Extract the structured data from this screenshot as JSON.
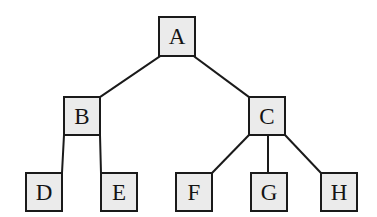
{
  "diagram": {
    "type": "tree",
    "title": "",
    "canvas": {
      "width": 377,
      "height": 217,
      "background": "#ffffff"
    },
    "style": {
      "node_fill": "#ebebeb",
      "node_border": "#1a1a1a",
      "node_border_width": 2,
      "edge_color": "#1a1a1a",
      "edge_width": 2,
      "label_color": "#141414"
    },
    "nodes": [
      {
        "id": "A",
        "label": "A",
        "x": 158,
        "y": 16,
        "w": 38,
        "h": 41,
        "level": 0
      },
      {
        "id": "B",
        "label": "B",
        "x": 63,
        "y": 96,
        "w": 38,
        "h": 40,
        "level": 1
      },
      {
        "id": "C",
        "label": "C",
        "x": 248,
        "y": 96,
        "w": 38,
        "h": 40,
        "level": 1
      },
      {
        "id": "D",
        "label": "D",
        "x": 25,
        "y": 172,
        "w": 38,
        "h": 40,
        "level": 2
      },
      {
        "id": "E",
        "label": "E",
        "x": 100,
        "y": 172,
        "w": 38,
        "h": 40,
        "level": 2
      },
      {
        "id": "F",
        "label": "F",
        "x": 175,
        "y": 172,
        "w": 38,
        "h": 40,
        "level": 2
      },
      {
        "id": "G",
        "label": "G",
        "x": 250,
        "y": 172,
        "w": 38,
        "h": 40,
        "level": 2
      },
      {
        "id": "H",
        "label": "H",
        "x": 320,
        "y": 172,
        "w": 38,
        "h": 40,
        "level": 2
      }
    ],
    "edges": [
      {
        "from": "A",
        "to": "B",
        "x1": 159,
        "y1": 57,
        "x2": 100,
        "y2": 97
      },
      {
        "from": "A",
        "to": "C",
        "x1": 195,
        "y1": 57,
        "x2": 249,
        "y2": 97
      },
      {
        "from": "B",
        "to": "D",
        "x1": 64,
        "y1": 135,
        "x2": 62,
        "y2": 173
      },
      {
        "from": "B",
        "to": "E",
        "x1": 100,
        "y1": 135,
        "x2": 101,
        "y2": 173
      },
      {
        "from": "C",
        "to": "F",
        "x1": 249,
        "y1": 135,
        "x2": 212,
        "y2": 173
      },
      {
        "from": "C",
        "to": "G",
        "x1": 268,
        "y1": 135,
        "x2": 268,
        "y2": 173
      },
      {
        "from": "C",
        "to": "H",
        "x1": 285,
        "y1": 135,
        "x2": 321,
        "y2": 173
      }
    ]
  }
}
